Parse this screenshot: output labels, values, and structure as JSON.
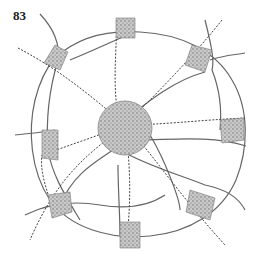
{
  "figure": {
    "number": "83",
    "elements": {
      "core": "central-town",
      "satellites": 8,
      "railway_lines": "dashed-tick",
      "roads": "solid"
    },
    "colors": {
      "ink": "#555555",
      "stipple": "#9a9a9a"
    }
  }
}
